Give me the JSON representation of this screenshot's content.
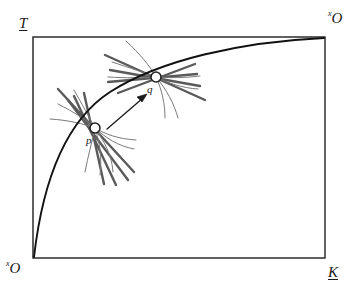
{
  "figure": {
    "type": "diagram",
    "background_color": "#ffffff",
    "frame": {
      "name": "plot-frame",
      "x": 33,
      "y": 37,
      "width": 292,
      "height": 221,
      "stroke_color": "#1f1f1f",
      "stroke_width": 1.4
    },
    "axis_labels": {
      "top_left": {
        "text": "T",
        "style": "italic-underlined"
      },
      "top_right": {
        "text": "O",
        "superscript": "x",
        "style": "italic"
      },
      "bottom_left": {
        "text": "O",
        "superscript": "x",
        "style": "italic"
      },
      "bottom_right": {
        "text": "K",
        "style": "italic-underlined"
      }
    },
    "main_curve": {
      "name": "frontier-curve",
      "stroke_color": "#111111",
      "stroke_width": 1.9,
      "path": "M 34 257 C 44 170, 70 118, 110 92 C 160 60, 240 42, 324 38",
      "start_label": "bottom-left origin",
      "end_label": "top-right corner"
    },
    "points": [
      {
        "name": "point-p",
        "label": "p",
        "cx": 95,
        "cy": 128,
        "radius": 5.0,
        "fill": "#ffffff",
        "stroke": "#1f1f1f",
        "label_offset": {
          "x": -9,
          "y": 9
        }
      },
      {
        "name": "point-q",
        "label": "q",
        "cx": 156,
        "cy": 77,
        "radius": 5.0,
        "fill": "#ffffff",
        "stroke": "#1f1f1f",
        "label_offset": {
          "x": -9,
          "y": 9
        }
      }
    ],
    "arrow": {
      "name": "transition-arrow",
      "from": {
        "x": 107,
        "y": 129
      },
      "to": {
        "x": 146,
        "y": 95
      },
      "stroke_color": "#1a1a1a",
      "stroke_width": 1.3,
      "head_length": 8
    },
    "ray_fan": {
      "name": "ray-fan",
      "stroke_color": "#595959",
      "stroke_width": 2.4,
      "description": "thick straight rays radiating through each marked point"
    },
    "curved_fan": {
      "name": "curved-fan",
      "stroke_color": "#767676",
      "stroke_width": 1.0,
      "description": "thin curved arcs radiating from each marked point"
    }
  }
}
